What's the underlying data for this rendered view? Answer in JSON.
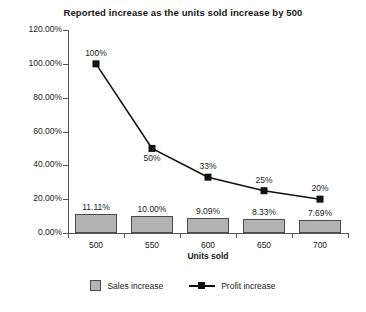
{
  "chart_data": {
    "type": "bar",
    "title": "Reported increase as the units sold increase by 500",
    "xlabel": "Units sold",
    "ylabel": "",
    "categories": [
      "500",
      "550",
      "600",
      "650",
      "700"
    ],
    "ylim": [
      0,
      120
    ],
    "ytick_labels": [
      "0.00%",
      "20.00%",
      "40.00%",
      "60.00%",
      "80.00%",
      "100.00%",
      "120.00%"
    ],
    "ytick_values": [
      0,
      20,
      40,
      60,
      80,
      100,
      120
    ],
    "grid": false,
    "legend_position": "bottom",
    "series": [
      {
        "name": "Sales increase",
        "type": "bar",
        "color": "#b3b3b3",
        "values": [
          11.11,
          10.0,
          9.09,
          8.33,
          7.69
        ],
        "data_labels": [
          "11.11%",
          "10.00%",
          "9.09%",
          "8.33%",
          "7.69%"
        ]
      },
      {
        "name": "Profit increase",
        "type": "line",
        "color": "#111111",
        "values": [
          100,
          50,
          33,
          25,
          20
        ],
        "data_labels": [
          "100%",
          "50%",
          "33%",
          "25%",
          "20%"
        ]
      }
    ]
  },
  "legend": {
    "items": [
      {
        "label": "Sales increase",
        "marker": "square-swatch-icon"
      },
      {
        "label": "Profit increase",
        "marker": "line-marker-icon"
      }
    ]
  }
}
